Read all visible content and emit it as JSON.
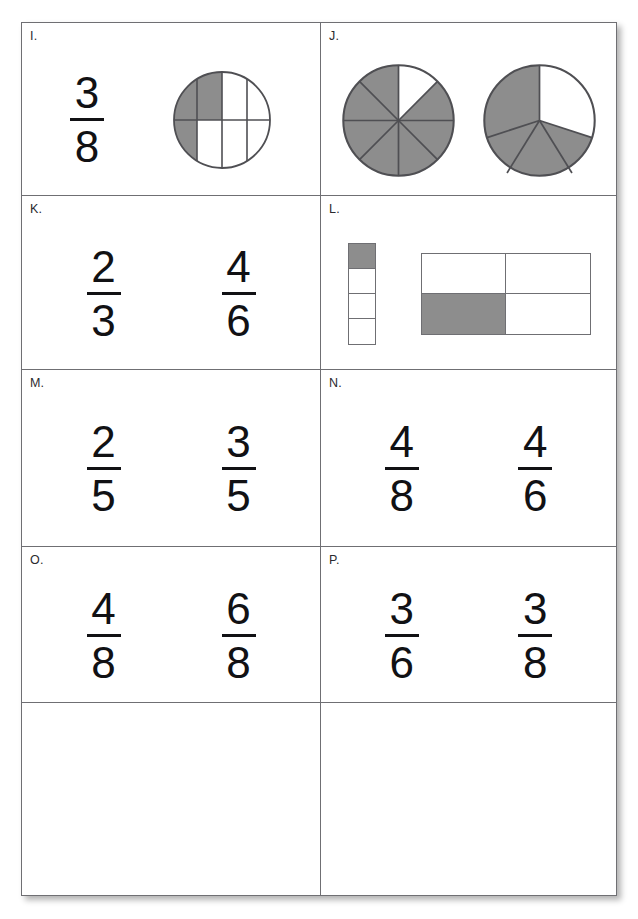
{
  "page": {
    "header_clipped_text": "",
    "ink_color": "#111114",
    "rule_color": "#6f6f73",
    "shade_color": "#8d8d8d",
    "background": "#ffffff"
  },
  "worksheet": {
    "cells": [
      {
        "label": "I.",
        "content_type": "fraction-and-circle",
        "fractions": [
          {
            "numerator": "3",
            "denominator": "8"
          }
        ],
        "circles": [
          {
            "parts": 8,
            "shaded": 3,
            "style": "quadrant-grid",
            "description": "circle divided by one horizontal and three vertical lines, upper-left region shaded"
          }
        ]
      },
      {
        "label": "J.",
        "content_type": "circles",
        "fractions": [],
        "circles": [
          {
            "parts": 8,
            "shaded": 7,
            "style": "sectors",
            "description": "eight equal sectors, seven shaded"
          },
          {
            "parts": 5,
            "shaded": 4,
            "style": "sectors",
            "description": "five equal sectors, four shaded"
          }
        ]
      },
      {
        "label": "K.",
        "content_type": "fractions",
        "fractions": [
          {
            "numerator": "2",
            "denominator": "3"
          },
          {
            "numerator": "4",
            "denominator": "6"
          }
        ],
        "circles": []
      },
      {
        "label": "L.",
        "content_type": "bars",
        "fractions": [],
        "bars": [
          {
            "style": "vertical-strip",
            "rows": 4,
            "cols": 1,
            "shaded_cells": [
              0
            ],
            "description": "vertical strip of four parts, top part shaded"
          },
          {
            "style": "grid",
            "rows": 2,
            "cols": 2,
            "shaded_cells": [
              2
            ],
            "description": "two-by-two rectangle, bottom-left part shaded"
          }
        ]
      },
      {
        "label": "M.",
        "content_type": "fractions",
        "fractions": [
          {
            "numerator": "2",
            "denominator": "5"
          },
          {
            "numerator": "3",
            "denominator": "5"
          }
        ],
        "circles": []
      },
      {
        "label": "N.",
        "content_type": "fractions",
        "fractions": [
          {
            "numerator": "4",
            "denominator": "8"
          },
          {
            "numerator": "4",
            "denominator": "6"
          }
        ],
        "circles": []
      },
      {
        "label": "O.",
        "content_type": "fractions",
        "fractions": [
          {
            "numerator": "4",
            "denominator": "8"
          },
          {
            "numerator": "6",
            "denominator": "8"
          }
        ],
        "circles": []
      },
      {
        "label": "P.",
        "content_type": "fractions",
        "fractions": [
          {
            "numerator": "3",
            "denominator": "6"
          },
          {
            "numerator": "3",
            "denominator": "8"
          }
        ],
        "circles": []
      },
      {
        "label": "",
        "content_type": "empty",
        "fractions": [],
        "circles": []
      },
      {
        "label": "",
        "content_type": "empty",
        "fractions": [],
        "circles": []
      }
    ]
  }
}
